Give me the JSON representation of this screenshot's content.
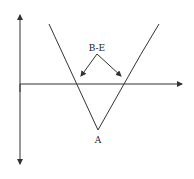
{
  "diagram": {
    "type": "long-straddle-payoff",
    "labels": {
      "breakeven": "B-E",
      "vertex": "A"
    },
    "colors": {
      "line": "#333333",
      "background": "#ffffff"
    }
  }
}
